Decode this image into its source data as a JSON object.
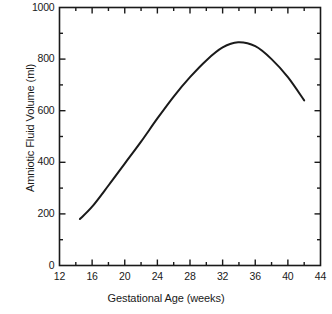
{
  "chart_data": {
    "type": "line",
    "title": "",
    "subtitle": "",
    "xlabel": "Gestational Age (weeks)",
    "ylabel": "Amniotic Fluid Volume (ml)",
    "xlim": [
      12,
      44
    ],
    "ylim": [
      0,
      1000
    ],
    "xticks": [
      12,
      16,
      20,
      24,
      28,
      32,
      36,
      40,
      44
    ],
    "xtick_labels": [
      "12",
      "16",
      "20",
      "24",
      "28",
      "32",
      "36",
      "40",
      "44"
    ],
    "xminor_step": 2,
    "yticks": [
      0,
      200,
      400,
      600,
      800,
      1000
    ],
    "ytick_labels": [
      "0",
      "200",
      "400",
      "600",
      "800",
      "1000"
    ],
    "yminor_step": 100,
    "grid": false,
    "legend": null,
    "frame": "box",
    "tick_direction": "in",
    "line_color": "#1a1a1a",
    "line_width": 2,
    "series": [
      {
        "name": "Amniotic fluid volume",
        "x": [
          14.5,
          16,
          18,
          20,
          22,
          24,
          26,
          28,
          30,
          32,
          33.9,
          36,
          38,
          40,
          42
        ],
        "y": [
          180,
          228,
          310,
          395,
          480,
          570,
          655,
          730,
          795,
          845,
          865,
          850,
          800,
          730,
          640
        ]
      }
    ],
    "annotations": [],
    "notes": {
      "peak_x": 33.9,
      "peak_y": 865,
      "start_x": 14.5,
      "start_y": 180,
      "end_x": 42,
      "end_y": 640
    }
  },
  "axes": {
    "x_tick_positions": [
      12,
      16,
      20,
      24,
      28,
      32,
      36,
      40,
      44
    ],
    "y_tick_positions": [
      0,
      200,
      400,
      600,
      800,
      1000
    ]
  },
  "colors": {
    "background": "#ffffff",
    "axis": "#1a1a1a",
    "curve": "#1a1a1a",
    "text": "#1a1a1a"
  }
}
